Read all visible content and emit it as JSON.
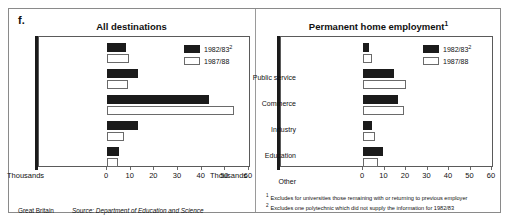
{
  "panel_letter": "f.",
  "footer": {
    "region": "Great Britain",
    "source": "Source: Department of Education and Science"
  },
  "footnotes": [
    {
      "marker": "1",
      "text": "Excludes for universities those remaining with or returning to previous employer"
    },
    {
      "marker": "2",
      "text": "Excludes one polytechnic which did not supply the information for 1982/83"
    }
  ],
  "colors": {
    "series_1982": "#1b1b1b",
    "series_1987": "#ffffff",
    "outline": "#6a6a6a",
    "frame": "#8a8a8a"
  },
  "chart_data": [
    {
      "type": "bar",
      "orientation": "horizontal",
      "title": "All destinations",
      "title_sup": "",
      "xlabel": "Thousands",
      "ylabel": "",
      "xlim": [
        0,
        60
      ],
      "xticks": [
        0,
        10,
        20,
        30,
        40,
        50,
        60
      ],
      "xtick_labels": [
        "0",
        "10",
        "20",
        "30",
        "40",
        "50",
        "60"
      ],
      "grid": false,
      "legend_position": "top-right",
      "categories": [
        "Research or academic study",
        "Further education or training",
        "Permanent home employment",
        "Unemployment or short-term employment",
        "Other known destinations"
      ],
      "series": [
        {
          "name": "1982/83",
          "name_sup": "2",
          "color": "#1b1b1b",
          "values": [
            8,
            13,
            43,
            13,
            5
          ]
        },
        {
          "name": "1987/88",
          "name_sup": "",
          "color": "#ffffff",
          "values": [
            9.5,
            9,
            53.5,
            7,
            4.5
          ]
        }
      ]
    },
    {
      "type": "bar",
      "orientation": "horizontal",
      "title": "Permanent home employment",
      "title_sup": "1",
      "xlabel": "Thousands",
      "ylabel": "",
      "xlim": [
        0,
        60
      ],
      "xticks": [
        0,
        10,
        20,
        30,
        40,
        50,
        60
      ],
      "xtick_labels": [
        "0",
        "10",
        "20",
        "30",
        "40",
        "50",
        "60"
      ],
      "grid": false,
      "legend_position": "top-right",
      "categories": [
        "Public service",
        "Commerce",
        "Industry",
        "Education",
        "Other"
      ],
      "series": [
        {
          "name": "1982/83",
          "name_sup": "2",
          "color": "#1b1b1b",
          "values": [
            3,
            14.5,
            16.5,
            4,
            9.5
          ]
        },
        {
          "name": "1987/88",
          "name_sup": "",
          "color": "#ffffff",
          "values": [
            4,
            20,
            19,
            5.5,
            7
          ]
        }
      ]
    }
  ]
}
